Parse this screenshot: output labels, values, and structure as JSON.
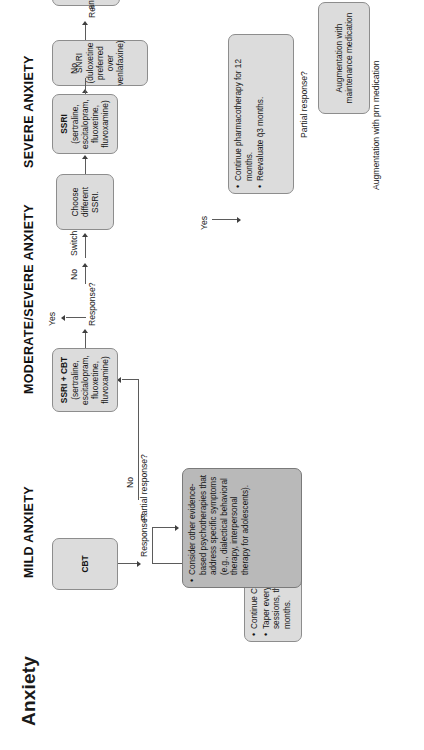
{
  "page": {
    "title": "Anxiety"
  },
  "sections": [
    {
      "id": "mild",
      "label": "MILD ANXIETY"
    },
    {
      "id": "modsev",
      "label": "MODERATE/SEVERE ANXIETY"
    },
    {
      "id": "severe",
      "label": "SEVERE ANXIETY"
    }
  ],
  "boxes": {
    "cbt": {
      "title": "CBT"
    },
    "continue_cbt": {
      "bullets": [
        "Continue CBT for 18–24 sessions.",
        "Taper every other week for 2 sessions, then q̄3 months and q̄6 months."
      ]
    },
    "other_psychotherapy": {
      "bullets": [
        "Consider other evidence-based psychotherapies that address specific symptoms (e.g., dialectical behavioral therapy, interpersonal therapy for adolescents)."
      ]
    },
    "ssri_cbt": {
      "title": "SSRI + CBT",
      "sub": "(sertraline, escitalopram, fluoxetine, fluvoxamine)"
    },
    "ssri": {
      "title": "SSRI",
      "sub": "(sertraline, escitalopram, fluoxetine, fluvoxamine)"
    },
    "choose_different_ssri": {
      "title": "Choose different SSRI."
    },
    "snri": {
      "title": "SNRI (duloxetine preferred over venlafaxine)"
    },
    "tricyclic": {
      "title": "Tricyclic antidepressant"
    },
    "continue_pharm": {
      "bullets": [
        "Continue pharmacotherapy for 12 months.",
        "Reevaluate q̄3 months."
      ]
    },
    "aug_maintenance": {
      "title": "Augmentation with maintenance medication"
    },
    "aug_prn": {
      "title": "Augmentation with prn medication"
    },
    "guanfacine": {
      "title": "Guanfacine ER"
    },
    "buspirone": {
      "title": "Buspirone"
    },
    "benzodiazepine": {
      "title": "Benzodiazepine"
    },
    "h1_antagonist": {
      "title": "H₁ antagonist"
    }
  },
  "edge_labels": {
    "response_1": "Response?",
    "response_2": "Response?",
    "response_3": "Response?",
    "response_4": "Response?",
    "response_5": "Response?",
    "yes_1": "Yes",
    "yes_2": "Yes",
    "yes_3": "Yes",
    "no_1": "No",
    "no_2": "No",
    "no_3": "No",
    "no_4": "No",
    "no_5": "No",
    "switch": "Switch",
    "partial_1": "Partial response?",
    "partial_2": "Partial response?"
  },
  "colors": {
    "box_fill": "#dcdcdc",
    "box_fill_dark": "#b9b9b9",
    "box_border": "#8d8d8d",
    "line": "#5b5b5b",
    "text": "#141414"
  }
}
